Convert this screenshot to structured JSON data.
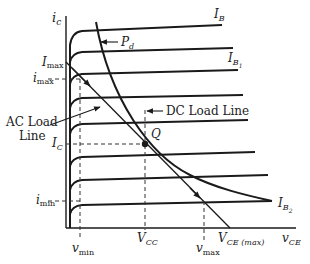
{
  "diagram": {
    "type": "transistor output characteristics with load lines",
    "axes": {
      "y_label": "i",
      "y_label_sub": "c",
      "x_label": "v",
      "x_label_sub": "CE"
    },
    "curve_labels": {
      "top": {
        "main": "I",
        "sub": "B"
      },
      "second": {
        "main": "I",
        "sub": "B",
        "subsub": "1"
      },
      "bottom": {
        "main": "I",
        "sub": "B",
        "subsub": "2"
      }
    },
    "power_curve_label": {
      "main": "P",
      "sub": "d"
    },
    "left_labels": {
      "Imax": {
        "main": "I",
        "sub": "max"
      },
      "imax": {
        "main": "i",
        "sub": "max"
      },
      "IC": {
        "main": "I",
        "sub": "C"
      },
      "imin": {
        "main": "i",
        "sub": "min"
      }
    },
    "bottom_labels": {
      "vmin": {
        "main": "v",
        "sub": "min"
      },
      "VCC": {
        "main": "V",
        "sub": "CC"
      },
      "vmax": {
        "main": "v",
        "sub": "max"
      },
      "VCEmax": {
        "main": "V",
        "sub": "CE (max)"
      }
    },
    "annotations": {
      "ac_load_line_1": "AC Load",
      "ac_load_line_2": "Line",
      "dc_load_line": "DC Load Line",
      "q_point": "Q"
    },
    "colors": {
      "stroke": "#1a1a1a",
      "text": "#222222",
      "background": "#ffffff"
    }
  }
}
